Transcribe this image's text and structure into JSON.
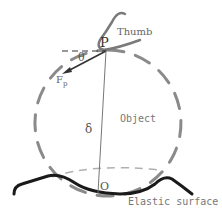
{
  "labels": {
    "thumb": "Thumb",
    "point_p": "P",
    "angle": "θ",
    "force": "F",
    "force_sub": "p",
    "delta": "δ",
    "object": "Object",
    "point_o": "O",
    "surface": "Elastic surface"
  },
  "colors": {
    "circle": "#8a8a8a",
    "thumb": "#7a7a7a",
    "arrow": "#333333",
    "surface": "#1a1a1a",
    "text": "#666666",
    "vertical": "#777777"
  }
}
